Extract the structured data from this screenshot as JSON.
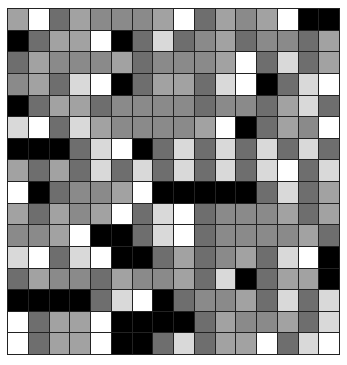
{
  "palette": {
    "K": "#000000",
    "D": "#6e6e6e",
    "M": "#8a8a8a",
    "L": "#a2a2a2",
    "P": "#d9d9d9",
    "W": "#ffffff"
  },
  "grid": {
    "rows": 16,
    "cols": 16,
    "cells": [
      "LWDLMMMLWDLMLWKK",
      "KDLLWKDPDMLDMMDL",
      "DLMMMLDMMMLWDPDL",
      "MLDPWKDLLDPWKDPW",
      "KDLLDMMMMDMMDLPD",
      "PWDPLMMMMLWKDLMW",
      "KKKDPWKDPDPDPDPD",
      "LDLDPDPDPDPDPWDP",
      "WKDMMLWKKKKKDPDL",
      "LDLMLWDPWDMMMLDL",
      "MMLWKKDPWDMMMMLD",
      "PWDPWKKDLDMLDPWK",
      "DLMMDLMMLDPKDLLK",
      "KKKKDPWKDMMLDPDP",
      "WDLLWKKKKDLMMLDP",
      "WDLLWKKDPDLLWDPW"
    ]
  }
}
